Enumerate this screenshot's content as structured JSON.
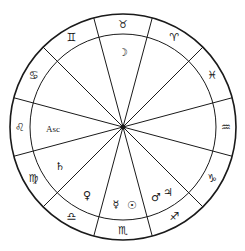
{
  "chart": {
    "title": "",
    "colors": {
      "line": "#1a1a1a",
      "background": "#ffffff"
    },
    "center": {
      "x": 123,
      "y": 127
    },
    "outer_radius": 113,
    "inner_radius": 93,
    "signs": [
      {
        "name": "taurus",
        "glyph": "♉",
        "angle": 90
      },
      {
        "name": "aries",
        "glyph": "♈",
        "angle": 60
      },
      {
        "name": "pisces",
        "glyph": "♓",
        "angle": 30
      },
      {
        "name": "aquarius",
        "glyph": "♒",
        "angle": 0
      },
      {
        "name": "capricorn",
        "glyph": "♑",
        "angle": -30
      },
      {
        "name": "sagittarius",
        "glyph": "♐",
        "angle": -60
      },
      {
        "name": "scorpio",
        "glyph": "♏",
        "angle": -90
      },
      {
        "name": "libra",
        "glyph": "♎",
        "angle": -120
      },
      {
        "name": "virgo",
        "glyph": "♍",
        "angle": -150
      },
      {
        "name": "leo",
        "glyph": "♌",
        "angle": 180
      },
      {
        "name": "cancer",
        "glyph": "♋",
        "angle": 150
      },
      {
        "name": "gemini",
        "glyph": "♊",
        "angle": 120
      }
    ],
    "planets": [
      {
        "name": "moon",
        "glyph": "☽",
        "x": 123,
        "y": 52
      },
      {
        "name": "ascendant",
        "label": "Asc",
        "x": 53,
        "y": 129
      },
      {
        "name": "saturn",
        "glyph": "♄",
        "x": 60,
        "y": 166
      },
      {
        "name": "venus",
        "glyph": "♀",
        "x": 87,
        "y": 195
      },
      {
        "name": "mercury",
        "glyph": "☿",
        "x": 116,
        "y": 204
      },
      {
        "name": "sun",
        "glyph": "☉",
        "x": 132,
        "y": 205
      },
      {
        "name": "mars",
        "glyph": "♂",
        "x": 156,
        "y": 197
      },
      {
        "name": "jupiter",
        "glyph": "♃",
        "x": 168,
        "y": 192
      }
    ]
  }
}
